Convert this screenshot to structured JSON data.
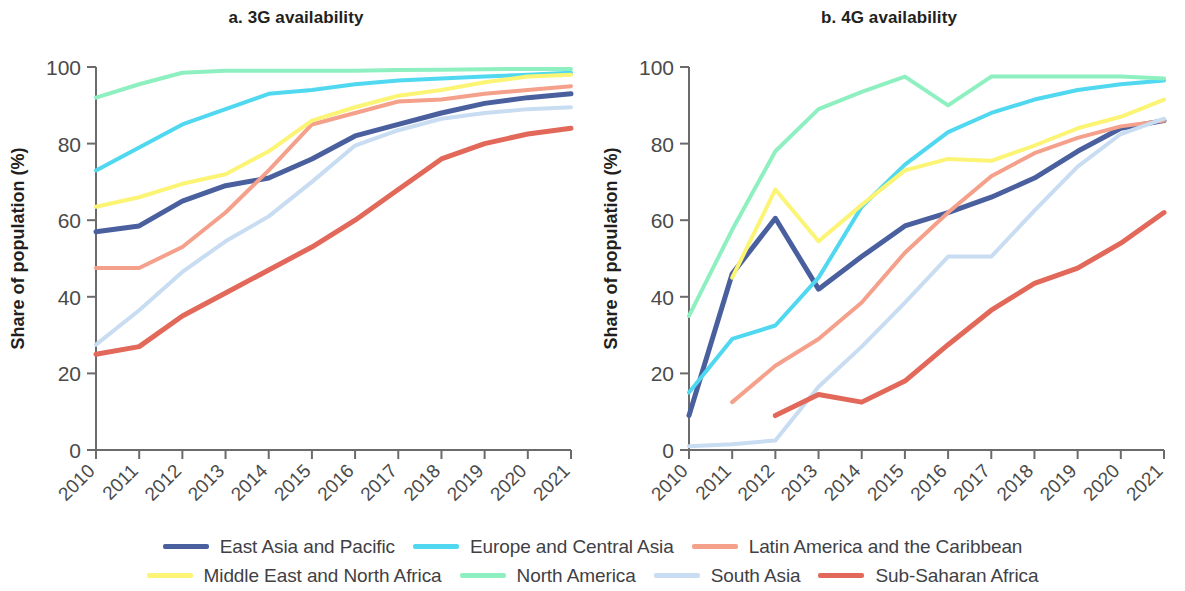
{
  "figure": {
    "ylabel": "Share of population (%)"
  },
  "chart_data": [
    {
      "type": "line",
      "title": "a. 3G availability",
      "xlabel": "",
      "ylabel": "Share of population (%)",
      "ylim": [
        0,
        100
      ],
      "yticks": [
        0,
        20,
        40,
        60,
        80,
        100
      ],
      "ytick_labels": [
        "0",
        "20",
        "40",
        "60",
        "80",
        "100"
      ],
      "x": [
        2010,
        2011,
        2012,
        2013,
        2014,
        2015,
        2016,
        2017,
        2018,
        2019,
        2020,
        2021
      ],
      "xtick_labels": [
        "2010",
        "2011",
        "2012",
        "2013",
        "2014",
        "2015",
        "2016",
        "2017",
        "2018",
        "2019",
        "2020",
        "2021"
      ],
      "grid": false,
      "legend_position": "bottom",
      "series": [
        {
          "name": "East Asia and Pacific",
          "color": "#4a5f9e",
          "values": [
            57,
            58.5,
            65,
            69,
            71,
            76,
            82,
            85,
            88,
            90.5,
            92,
            93
          ]
        },
        {
          "name": "Europe and Central Asia",
          "color": "#4fd8ef",
          "values": [
            73,
            79,
            85,
            89,
            93,
            94,
            95.5,
            96.5,
            97,
            97.5,
            98,
            98.5
          ]
        },
        {
          "name": "Latin America and the Caribbean",
          "color": "#f4a08a",
          "values": [
            47.5,
            47.5,
            53,
            62,
            73,
            85,
            88,
            91,
            91.5,
            93,
            94,
            95
          ]
        },
        {
          "name": "Middle East and North Africa",
          "color": "#fbf474",
          "values": [
            63.5,
            66,
            69.5,
            72,
            78,
            86,
            89.5,
            92.5,
            94,
            96,
            97.5,
            98
          ]
        },
        {
          "name": "North America",
          "color": "#8ef0c0",
          "values": [
            92,
            95.5,
            98.5,
            99,
            99,
            99,
            99,
            99.2,
            99.3,
            99.4,
            99.5,
            99.5
          ]
        },
        {
          "name": "South Asia",
          "color": "#c8dcf2",
          "values": [
            27.5,
            36.5,
            46.5,
            54.5,
            61,
            70,
            79.5,
            83.5,
            86.5,
            88,
            89,
            89.5
          ]
        },
        {
          "name": "Sub-Saharan Africa",
          "color": "#e2685a",
          "values": [
            25,
            27,
            35,
            41,
            47,
            53,
            60,
            68,
            76,
            80,
            82.5,
            84
          ]
        }
      ]
    },
    {
      "type": "line",
      "title": "b. 4G availability",
      "xlabel": "",
      "ylabel": "Share of population (%)",
      "ylim": [
        0,
        100
      ],
      "yticks": [
        0,
        20,
        40,
        60,
        80,
        100
      ],
      "ytick_labels": [
        "0",
        "20",
        "40",
        "60",
        "80",
        "100"
      ],
      "x": [
        2010,
        2011,
        2012,
        2013,
        2014,
        2015,
        2016,
        2017,
        2018,
        2019,
        2020,
        2021
      ],
      "xtick_labels": [
        "2010",
        "2011",
        "2012",
        "2013",
        "2014",
        "2015",
        "2016",
        "2017",
        "2018",
        "2019",
        "2020",
        "2021"
      ],
      "grid": false,
      "legend_position": "bottom",
      "series": [
        {
          "name": "East Asia and Pacific",
          "color": "#4a5f9e",
          "values": [
            9,
            46,
            60.5,
            42,
            50.5,
            58.5,
            62,
            66,
            71,
            78,
            84,
            86
          ]
        },
        {
          "name": "Europe and Central Asia",
          "color": "#4fd8ef",
          "values": [
            15,
            29,
            32.5,
            45,
            63.5,
            74.5,
            83,
            88,
            91.5,
            94,
            95.5,
            96.5
          ]
        },
        {
          "name": "Latin America and the Caribbean",
          "color": "#f4a08a",
          "values": [
            0,
            12.5,
            22,
            29,
            38.5,
            51.5,
            62,
            71.5,
            77.5,
            81.5,
            84.5,
            86
          ]
        },
        {
          "name": "Middle East and North Africa",
          "color": "#fbf474",
          "values": [
            0,
            45,
            68,
            54.5,
            64,
            73,
            76,
            75.5,
            79.5,
            84,
            87,
            91.5
          ]
        },
        {
          "name": "North America",
          "color": "#8ef0c0",
          "values": [
            35,
            57.5,
            78,
            89,
            93.5,
            97.5,
            90,
            97.5,
            97.5,
            97.5,
            97.5,
            97
          ]
        },
        {
          "name": "South Asia",
          "color": "#c8dcf2",
          "values": [
            1,
            1.5,
            2.5,
            16.5,
            27,
            38.5,
            50.5,
            50.5,
            62.5,
            74,
            82.5,
            86.5
          ]
        },
        {
          "name": "Sub-Saharan Africa",
          "color": "#e2685a",
          "values": [
            0,
            0,
            9,
            14.5,
            12.5,
            18,
            27.5,
            36.5,
            43.5,
            47.5,
            54,
            62
          ]
        }
      ]
    }
  ],
  "legend": {
    "row1": [
      {
        "label": "East Asia and Pacific",
        "color": "#4a5f9e"
      },
      {
        "label": "Europe and Central Asia",
        "color": "#4fd8ef"
      },
      {
        "label": "Latin America and the Caribbean",
        "color": "#f4a08a"
      }
    ],
    "row2": [
      {
        "label": "Middle East and North Africa",
        "color": "#fbf474"
      },
      {
        "label": "North America",
        "color": "#8ef0c0"
      },
      {
        "label": "South Asia",
        "color": "#c8dcf2"
      },
      {
        "label": "Sub-Saharan Africa",
        "color": "#e2685a"
      }
    ]
  }
}
